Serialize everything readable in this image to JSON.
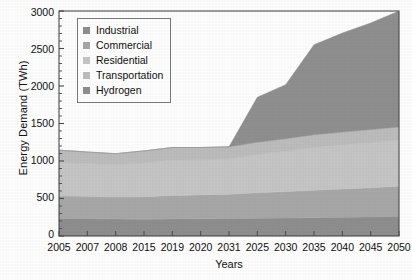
{
  "chart_data": {
    "type": "area",
    "stacked": true,
    "title": "",
    "xlabel": "Years",
    "ylabel": "Energy Demand (TWh)",
    "ylim": [
      0,
      3000
    ],
    "ytick_step": 500,
    "yticks": [
      0,
      500,
      1000,
      1500,
      2000,
      2500,
      3000
    ],
    "ytick_labels": [
      "0",
      "500",
      "1000",
      "1500",
      "2000",
      "2500",
      "3000"
    ],
    "minor_ytick_step": 100,
    "grid": false,
    "legend_position": "upper left (inside axes)",
    "categories": [
      "2005",
      "2007",
      "2008",
      "2015",
      "2019",
      "2020",
      "2031",
      "2025",
      "2030",
      "2035",
      "2040",
      "2045",
      "2050"
    ],
    "series": [
      {
        "name": "Industrial",
        "color": "#8f8f8f",
        "values": [
          235,
          232,
          228,
          225,
          228,
          230,
          232,
          236,
          240,
          245,
          250,
          255,
          262
        ]
      },
      {
        "name": "Commercial",
        "color": "#a8a8a8",
        "values": [
          300,
          298,
          292,
          300,
          312,
          318,
          326,
          340,
          352,
          366,
          378,
          390,
          402
        ]
      },
      {
        "name": "Residential",
        "color": "#c6c6c6",
        "values": [
          450,
          438,
          430,
          452,
          470,
          468,
          470,
          510,
          540,
          570,
          586,
          600,
          612
        ]
      },
      {
        "name": "Transportation",
        "color": "#bdbdbd",
        "values": [
          160,
          152,
          148,
          158,
          170,
          164,
          162,
          164,
          166,
          169,
          172,
          175,
          178
        ]
      },
      {
        "name": "Hydrogen",
        "color": "#909090",
        "values": [
          0,
          0,
          0,
          0,
          0,
          0,
          0,
          600,
          720,
          1200,
          1320,
          1420,
          1546
        ]
      }
    ],
    "totals": [
      1145,
      1120,
      1098,
      1135,
      1180,
      1180,
      1190,
      1850,
      2018,
      2550,
      2706,
      2840,
      3000
    ]
  },
  "legend": {
    "items": [
      {
        "label": "Industrial",
        "swatch": "#8f8f8f"
      },
      {
        "label": "Commercial",
        "swatch": "#a8a8a8"
      },
      {
        "label": "Residential",
        "swatch": "#c6c6c6"
      },
      {
        "label": "Transportation",
        "swatch": "#bdbdbd"
      },
      {
        "label": "Hydrogen",
        "swatch": "#909090"
      }
    ]
  },
  "axes": {
    "y_title": "Energy Demand (TWh)",
    "x_title": "Years",
    "y_labels": [
      "3000",
      "2500",
      "2000",
      "1500",
      "1000",
      "500",
      "0"
    ],
    "x_labels": [
      "2005",
      "2007",
      "2008",
      "2015",
      "2019",
      "2020",
      "2031",
      "2025",
      "2030",
      "2035",
      "2040",
      "2045",
      "2050"
    ]
  },
  "style": {
    "axis_color": "#4a4a4a",
    "text_color": "#111111",
    "background": "#ffffff",
    "legend_border": "#7a7a7a"
  }
}
